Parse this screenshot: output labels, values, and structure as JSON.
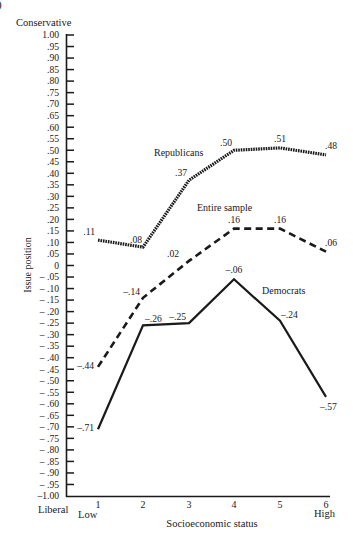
{
  "chart_data": {
    "type": "line",
    "title": "",
    "xlabel": "Socioeconomic status",
    "ylabel": "Issue position",
    "y_top_label": "Conservative",
    "y_bottom_label": "Liberal",
    "x_low_label": "Low",
    "x_high_label": "High",
    "x": [
      1,
      2,
      3,
      4,
      5,
      6
    ],
    "categories": [
      "1",
      "2",
      "3",
      "4",
      "5",
      "6"
    ],
    "ylim": [
      -1.0,
      1.0
    ],
    "ytick_step": 0.05,
    "yticks": [
      "1.00",
      ".95",
      ".90",
      ".85",
      ".80",
      ".75",
      ".70",
      ".65",
      ".60",
      ".55",
      ".50",
      ".45",
      ".40",
      ".35",
      ".30",
      ".25",
      ".20",
      ".15",
      ".10",
      ".05",
      "0",
      "– .05",
      "– .10",
      "– .15",
      "– .20",
      "– .25",
      "– .30",
      "– .35",
      "– .40",
      "– .45",
      "– .50",
      "– .55",
      "– .60",
      "– .65",
      "– .70",
      "– .75",
      "– .80",
      "– .85",
      "– .90",
      "– .95",
      "–1.00"
    ],
    "grid": false,
    "legend": "inline labels",
    "series": [
      {
        "name": "Republicans",
        "style": "dotted",
        "values": [
          0.11,
          0.08,
          0.37,
          0.5,
          0.51,
          0.48
        ],
        "labels": [
          ".11",
          ".08",
          ".37",
          ".50",
          ".51",
          ".48"
        ]
      },
      {
        "name": "Entire sample",
        "style": "dashed",
        "values": [
          -0.44,
          -0.14,
          0.02,
          0.16,
          0.16,
          0.06
        ],
        "labels": [
          "–.44",
          "–.14",
          ".02",
          ".16",
          ".16",
          ".06"
        ]
      },
      {
        "name": "Democrats",
        "style": "solid",
        "values": [
          -0.71,
          -0.26,
          -0.25,
          -0.06,
          -0.24,
          -0.57
        ],
        "labels": [
          "–.71",
          "–.26",
          "–.25",
          "–.06",
          "–.24",
          "–.57"
        ]
      }
    ]
  },
  "corner_mark": ")"
}
